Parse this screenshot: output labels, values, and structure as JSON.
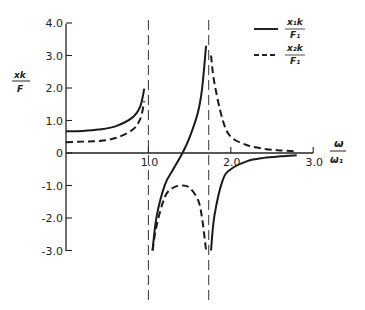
{
  "chart_data": {
    "type": "line",
    "title": "",
    "xlabel": "ω/ω₁",
    "ylabel": "xk/F",
    "xlim": [
      0,
      3.0
    ],
    "ylim": [
      -3.0,
      4.0
    ],
    "grid": false,
    "legend_position": "upper right",
    "x_ticks": [
      {
        "value": 1.0,
        "label": "1.0"
      },
      {
        "value": 2.0,
        "label": "2.0"
      },
      {
        "value": 3.0,
        "label": "3.0"
      }
    ],
    "y_ticks": [
      {
        "value": 4.0,
        "label": "4.0"
      },
      {
        "value": 3.0,
        "label": "3.0"
      },
      {
        "value": 2.0,
        "label": "2.0"
      },
      {
        "value": 1.0,
        "label": "1.0"
      },
      {
        "value": 0,
        "label": "0"
      },
      {
        "value": -1.0,
        "label": "-1.0"
      },
      {
        "value": -2.0,
        "label": "-2.0"
      },
      {
        "value": -3.0,
        "label": "-3.0"
      }
    ],
    "asymptotes": [
      1.0,
      1.732
    ],
    "series": [
      {
        "name": "x1k/F1",
        "style": "solid",
        "x": [
          0,
          0.2,
          0.4,
          0.6,
          0.8,
          0.9,
          0.95,
          1.05,
          1.1,
          1.2,
          1.3,
          1.414,
          1.5,
          1.6,
          1.65,
          1.7,
          1.76,
          1.8,
          1.9,
          2.0,
          2.2,
          2.4,
          2.6,
          2.8
        ],
        "values": [
          0.67,
          0.68,
          0.72,
          0.82,
          1.08,
          1.43,
          1.98,
          -3.0,
          -1.95,
          -0.98,
          -0.51,
          0.0,
          0.48,
          1.24,
          1.95,
          3.3,
          -3.0,
          -1.95,
          -0.85,
          -0.5,
          -0.25,
          -0.15,
          -0.1,
          -0.07
        ]
      },
      {
        "name": "x2k/F1",
        "style": "dashed",
        "x": [
          0,
          0.2,
          0.4,
          0.6,
          0.8,
          0.9,
          0.95,
          1.05,
          1.1,
          1.2,
          1.3,
          1.414,
          1.5,
          1.6,
          1.65,
          1.7,
          1.76,
          1.8,
          1.9,
          2.0,
          2.2,
          2.4,
          2.6,
          2.8
        ],
        "values": [
          0.33,
          0.35,
          0.37,
          0.46,
          0.7,
          1.04,
          1.59,
          -3.0,
          -2.23,
          -1.35,
          -1.07,
          -1.0,
          -1.07,
          -1.43,
          -1.98,
          -3.0,
          3.0,
          2.17,
          1.03,
          0.5,
          0.24,
          0.13,
          0.08,
          0.05
        ]
      }
    ]
  },
  "legend": {
    "items": [
      {
        "num": "x₁k",
        "den": "F₁",
        "style": "solid"
      },
      {
        "num": "x₂k",
        "den": "F₁",
        "style": "dashed"
      }
    ]
  },
  "axes": {
    "ylabel_num": "xk",
    "ylabel_den": "F",
    "xlabel_num": "ω",
    "xlabel_den": "ω₁"
  }
}
